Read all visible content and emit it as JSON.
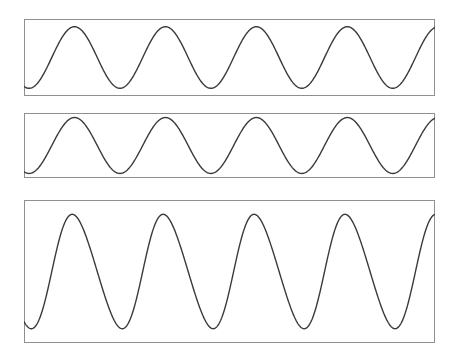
{
  "figure": {
    "title": "",
    "background_color": "#ffffff",
    "width": 460,
    "height": 356,
    "panel_count": 3
  },
  "style": {
    "frame_color": "#8f8f8f",
    "frame_width": 1,
    "wave_color": "#3a3a3a",
    "wave_width": 1.4,
    "panel_fill": "#ffffff"
  },
  "chart_data": {
    "type": "line",
    "title": "",
    "xlabel": "",
    "ylabel": "",
    "grid": false,
    "legend": "none",
    "shared_x": {
      "label": "",
      "range": [
        0,
        4.6
      ],
      "unit": "cycles",
      "tick_labels": []
    },
    "panels": [
      {
        "name": "panel-top",
        "index": 0,
        "frame": {
          "x": 24,
          "y": 19,
          "width": 411,
          "height": 77
        },
        "series": [
          {
            "name": "sine-wave-small",
            "waveform": "sine",
            "cycles": 4.52,
            "period_px": 87,
            "phase_deg": -110,
            "amplitude_fraction": 0.4,
            "baseline_fraction": 0.5,
            "peak_count": 5,
            "trough_count": 4,
            "peak_y_px": 25,
            "trough_y_px": 88,
            "first_peak_x_px": 54,
            "samples": 700
          }
        ],
        "ylim": [
          -1,
          1
        ]
      },
      {
        "name": "panel-middle",
        "index": 1,
        "frame": {
          "x": 24,
          "y": 113,
          "width": 411,
          "height": 65
        },
        "series": [
          {
            "name": "sine-wave-medium",
            "waveform": "sine",
            "cycles": 4.52,
            "period_px": 87,
            "phase_deg": -110,
            "amplitude_fraction": 0.43,
            "baseline_fraction": 0.5,
            "peak_count": 5,
            "trough_count": 4,
            "peak_y_px": 120,
            "trough_y_px": 173,
            "first_peak_x_px": 54,
            "samples": 700
          }
        ],
        "ylim": [
          -1,
          1
        ]
      },
      {
        "name": "panel-bottom",
        "index": 2,
        "frame": {
          "x": 24,
          "y": 200,
          "width": 411,
          "height": 143
        },
        "series": [
          {
            "name": "sine-wave-large",
            "waveform": "sine",
            "cycles": 4.52,
            "period_px": 87,
            "phase_deg": -110,
            "amplitude_fraction": 0.4,
            "baseline_fraction": 0.5,
            "peak_count": 5,
            "trough_count": 4,
            "peak_y_px": 222,
            "trough_y_px": 330,
            "first_peak_x_px": 54,
            "samples": 700,
            "trough_sharpening": 0.16
          }
        ],
        "ylim": [
          -1,
          1
        ]
      }
    ]
  }
}
